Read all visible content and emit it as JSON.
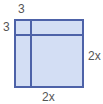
{
  "diagram": {
    "type": "area-model-square",
    "colors": {
      "fill": "#d3def4",
      "stroke": "#4d62a8",
      "label": "#555555"
    },
    "labels": {
      "top": "3",
      "left": "3",
      "right": "2x",
      "bottom": "2x"
    }
  }
}
